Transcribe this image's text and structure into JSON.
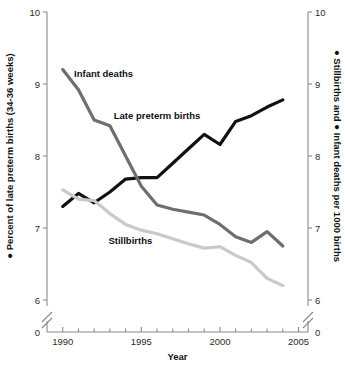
{
  "chart_data": {
    "type": "line",
    "title": "",
    "xlabel": "Year",
    "ylabel_left": "● Percent of late preterm births (34-36 weeks)",
    "ylabel_right": "● Stillbirths and ● Infant deaths per 1000 births",
    "x": [
      1990,
      1991,
      1992,
      1993,
      1994,
      1995,
      1996,
      1997,
      1998,
      1999,
      2000,
      2001,
      2002,
      2003,
      2004
    ],
    "xlim": [
      1989,
      2005.6
    ],
    "ylim": [
      6.0,
      10.0
    ],
    "y_ticks": [
      6,
      7,
      8,
      9,
      10
    ],
    "y_ticks_right": [
      6,
      7,
      8,
      9,
      10
    ],
    "x_ticks": [
      1990,
      1995,
      2000,
      2005
    ],
    "x_minor_ticks": [
      1991,
      1992,
      1993,
      1994,
      1996,
      1997,
      1998,
      1999,
      2001,
      2002,
      2003,
      2004
    ],
    "axis_break": true,
    "axis_break_zero_label": "0",
    "grid": false,
    "legend": "inline-labels",
    "series": [
      {
        "name": "Late preterm births",
        "color": "#111111",
        "axis": "left",
        "label_x": 1996.0,
        "label_y": 8.52,
        "values": [
          7.3,
          7.48,
          7.35,
          7.5,
          7.68,
          7.7,
          7.7,
          7.9,
          8.1,
          8.3,
          8.16,
          8.48,
          8.56,
          8.68,
          8.78
        ]
      },
      {
        "name": "Infant deaths",
        "color": "#6e6e6e",
        "axis": "right",
        "label_x": 1992.6,
        "label_y": 9.1,
        "values": [
          9.2,
          8.92,
          8.5,
          8.42,
          8.0,
          7.58,
          7.32,
          7.26,
          7.22,
          7.18,
          7.05,
          6.88,
          6.8,
          6.95,
          6.75
        ]
      },
      {
        "name": "Stillbirths",
        "color": "#c9c9c9",
        "axis": "right",
        "label_x": 1994.3,
        "label_y": 6.78,
        "values": [
          7.53,
          7.4,
          7.38,
          7.2,
          7.05,
          6.97,
          6.92,
          6.85,
          6.78,
          6.72,
          6.74,
          6.62,
          6.52,
          6.3,
          6.2
        ]
      }
    ]
  }
}
